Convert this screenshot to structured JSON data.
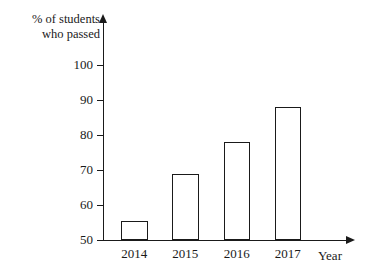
{
  "chart_data": {
    "type": "bar",
    "title": "",
    "xlabel": "Year",
    "ylabel": "% of students\nwho passed",
    "categories": [
      "2014",
      "2015",
      "2016",
      "2017"
    ],
    "values": [
      55.5,
      69,
      78,
      88
    ],
    "ylim": [
      50,
      105
    ],
    "yticks": [
      50,
      60,
      70,
      80,
      90,
      100
    ],
    "ytick_labels": [
      "50",
      "60",
      "70",
      "80",
      "90",
      "100"
    ],
    "grid": false,
    "legend": null,
    "bar_style": {
      "fill": "#ffffff",
      "edge": "#1a1a1a"
    },
    "axis_color": "#1a1a1a",
    "background": "#ffffff"
  }
}
